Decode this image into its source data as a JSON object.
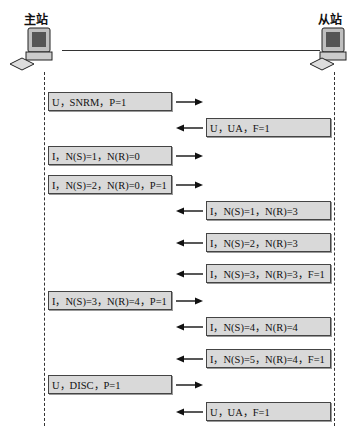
{
  "stations": {
    "primary": {
      "label": "主站",
      "icon": "computer-icon"
    },
    "secondary": {
      "label": "从站",
      "icon": "computer-icon"
    }
  },
  "messages": [
    {
      "dir": "right",
      "text": "U，SNRM，P=1",
      "top": 92
    },
    {
      "dir": "left",
      "text": "U，UA，F=1",
      "top": 118
    },
    {
      "dir": "right",
      "text": "I，N(S)=1，N(R)=0",
      "top": 146
    },
    {
      "dir": "right",
      "text": "I，N(S)=2，N(R)=0，P=1",
      "top": 175
    },
    {
      "dir": "left",
      "text": "I，N(S)=1，N(R)=3",
      "top": 201
    },
    {
      "dir": "left",
      "text": "I，N(S)=2，N(R)=3",
      "top": 233
    },
    {
      "dir": "left",
      "text": "I，N(S)=3，N(R)=3，F=1",
      "top": 264
    },
    {
      "dir": "right",
      "text": "I，N(S)=3，N(R)=4，P=1",
      "top": 291
    },
    {
      "dir": "left",
      "text": "I，N(S)=4，N(R)=4",
      "top": 317
    },
    {
      "dir": "left",
      "text": "I，N(S)=5，N(R)=4，F=1",
      "top": 349
    },
    {
      "dir": "right",
      "text": "U，DISC，P=1",
      "top": 375
    },
    {
      "dir": "left",
      "text": "U，UA，F=1",
      "top": 402
    }
  ],
  "colors": {
    "box_fill": "#d9d9d9",
    "box_border": "#444444",
    "line": "#333333"
  }
}
